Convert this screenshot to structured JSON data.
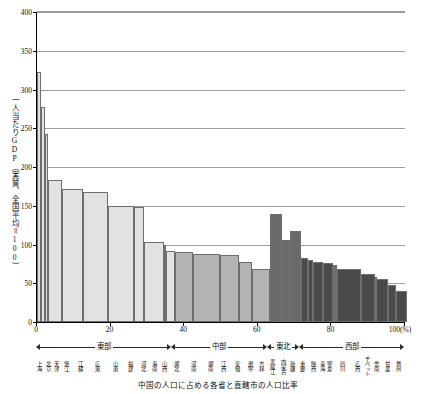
{
  "chart_data": {
    "type": "bar",
    "title": "",
    "caption": "中国の人口に占める各省と直轄市の人口比率",
    "ylabel": "一人当たりGDP（実質、全国平均＝100）",
    "xlabel": "",
    "xunit": "(%)",
    "ylim": [
      0,
      400
    ],
    "xlim": [
      0,
      100
    ],
    "yticks": [
      0,
      50,
      100,
      150,
      200,
      250,
      300,
      350,
      400
    ],
    "xticks": [
      0,
      20,
      40,
      60,
      80,
      100
    ],
    "grid": "horizontal",
    "legend": "none",
    "note": "Variable-width bar chart (Marimekko style): bar width = share of China's population (%), bar height = per-capita GDP index (national average = 100).",
    "regions": [
      {
        "name": "東部",
        "start": 0.0,
        "end": 36.8,
        "color": "#e2e2e2"
      },
      {
        "name": "中部",
        "start": 36.8,
        "end": 62.8,
        "color": "#b4b4b4"
      },
      {
        "name": "東北",
        "start": 62.8,
        "end": 71.6,
        "color": "#6a6a6a"
      },
      {
        "name": "西部",
        "start": 71.6,
        "end": 100.0,
        "color": "#4a4a4a"
      }
    ],
    "categories": [
      "上海",
      "北京",
      "天津",
      "浙江",
      "江蘇",
      "広東",
      "山東",
      "福建",
      "河北",
      "海南",
      "山西",
      "湖北",
      "河南",
      "湖南",
      "江西",
      "安徽",
      "遼寧",
      "吉林",
      "黒龍江",
      "内蒙古",
      "新疆",
      "重慶",
      "陝西",
      "青海",
      "寧夏",
      "四川",
      "広西",
      "チベット",
      "雲南",
      "甘粛",
      "貴州"
    ],
    "values": [
      322,
      278,
      242,
      183,
      172,
      168,
      150,
      148,
      103,
      100,
      91,
      90,
      88,
      86,
      78,
      68,
      140,
      106,
      118,
      83,
      80,
      78,
      76,
      74,
      73,
      68,
      62,
      58,
      55,
      48,
      40
    ],
    "widths": [
      1.2,
      1.1,
      0.8,
      3.7,
      5.8,
      6.6,
      7.2,
      2.7,
      5.3,
      0.6,
      2.6,
      4.7,
      7.5,
      5.2,
      3.3,
      5.0,
      3.3,
      2.1,
      3.0,
      1.9,
      1.5,
      2.5,
      2.9,
      0.4,
      0.5,
      6.7,
      3.8,
      0.2,
      3.4,
      2.0,
      3.0
    ]
  }
}
